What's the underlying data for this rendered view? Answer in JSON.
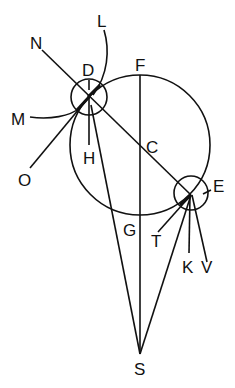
{
  "diagram": {
    "type": "geometric-astronomy",
    "stroke_color": "#111111",
    "background": "#ffffff",
    "labels": {
      "N": "N",
      "L": "L",
      "D": "D",
      "F": "F",
      "M": "M",
      "H": "H",
      "C": "C",
      "O": "O",
      "E": "E",
      "G": "G",
      "T": "T",
      "K": "K",
      "V": "V",
      "S": "S"
    },
    "circles": [
      {
        "name": "large-orbit-circle",
        "center": [
          140,
          145
        ],
        "r": 70
      },
      {
        "name": "small-circle-D",
        "center": [
          89,
          97
        ],
        "r": 18
      },
      {
        "name": "small-circle-E",
        "center": [
          191,
          193
        ],
        "r": 17
      }
    ]
  }
}
